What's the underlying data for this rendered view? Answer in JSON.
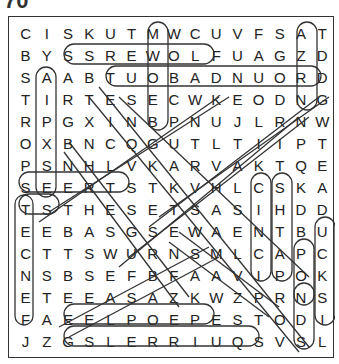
{
  "puzzle": {
    "number": "70",
    "rows": [
      "CISKUTMWCUVFSAT",
      "BYSSREWOLFUAGZD",
      "SAABTUOBADNUORD",
      "TIRTESECWKEODNG",
      "RPGXINBPNUJLRNW",
      "OXBNCQGUTLTIIPT",
      "PSNHLVKARVAKTQE",
      "SEERTSTKVHLCSKA",
      "TSTHESETSASIHDD",
      "EEBASGSEWAENTBU",
      "CTTSWURNSMLCAPC",
      "NSBSEFBFAAVIPOK",
      "ETEEASAZKWZPRNS",
      "FAEELPOEPESTODI",
      "JZGSLERRIUQSVSL"
    ],
    "found_words": [
      {
        "word": "SAR G",
        "note": "vertical",
        "start": [
          0,
          2
        ],
        "end": [
          4,
          2
        ]
      },
      {
        "word": "SREWOLF",
        "start": [
          1,
          3
        ],
        "end": [
          1,
          9
        ]
      },
      {
        "word": "TUOBADNUOR",
        "start": [
          2,
          4
        ],
        "end": [
          2,
          13
        ]
      },
      {
        "word": "SGOD",
        "start": [
          0,
          12
        ],
        "end": [
          3,
          12
        ]
      },
      {
        "word": "STROP",
        "start": [
          2,
          0
        ],
        "end": [
          7,
          0
        ]
      },
      {
        "word": "SEERTS",
        "start": [
          7,
          0
        ],
        "end": [
          7,
          4
        ]
      },
      {
        "word": "TS",
        "start": [
          8,
          0
        ],
        "end": [
          8,
          1
        ]
      },
      {
        "word": "ECNEF",
        "start": [
          9,
          0
        ],
        "end": [
          13,
          0
        ]
      },
      {
        "word": "CLIP",
        "start": [
          7,
          11
        ],
        "end": [
          11,
          11
        ]
      },
      {
        "word": "SHTAP",
        "start": [
          7,
          12
        ],
        "end": [
          11,
          12
        ]
      },
      {
        "word": "POK",
        "start": [
          10,
          13
        ],
        "end": [
          12,
          13
        ]
      },
      {
        "word": "DUCKS",
        "start": [
          8,
          14
        ],
        "end": [
          12,
          14
        ]
      },
      {
        "word": "SDOG",
        "note": "col 13 bottom",
        "start": [
          12,
          13
        ],
        "end": [
          14,
          13
        ]
      },
      {
        "word": "ELPOEP",
        "start": [
          13,
          3
        ],
        "end": [
          13,
          8
        ]
      },
      {
        "word": "SLERRIUQS",
        "start": [
          14,
          3
        ],
        "end": [
          14,
          11
        ]
      }
    ]
  }
}
